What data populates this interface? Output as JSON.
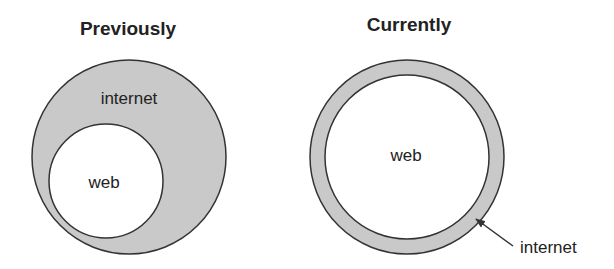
{
  "colors": {
    "fill": "#c9c9c9",
    "stroke": "#333333",
    "background": "#ffffff",
    "text": "#222222"
  },
  "panels": [
    {
      "title": "Previously",
      "outer_label": "internet",
      "inner_label": "web",
      "description": "web is a smaller circle inside the larger internet circle"
    },
    {
      "title": "Currently",
      "outer_label": "internet",
      "inner_label": "web",
      "description": "web fills nearly the whole internet circle, leaving only a thin ring",
      "callout": "arrow from label to ring"
    }
  ]
}
